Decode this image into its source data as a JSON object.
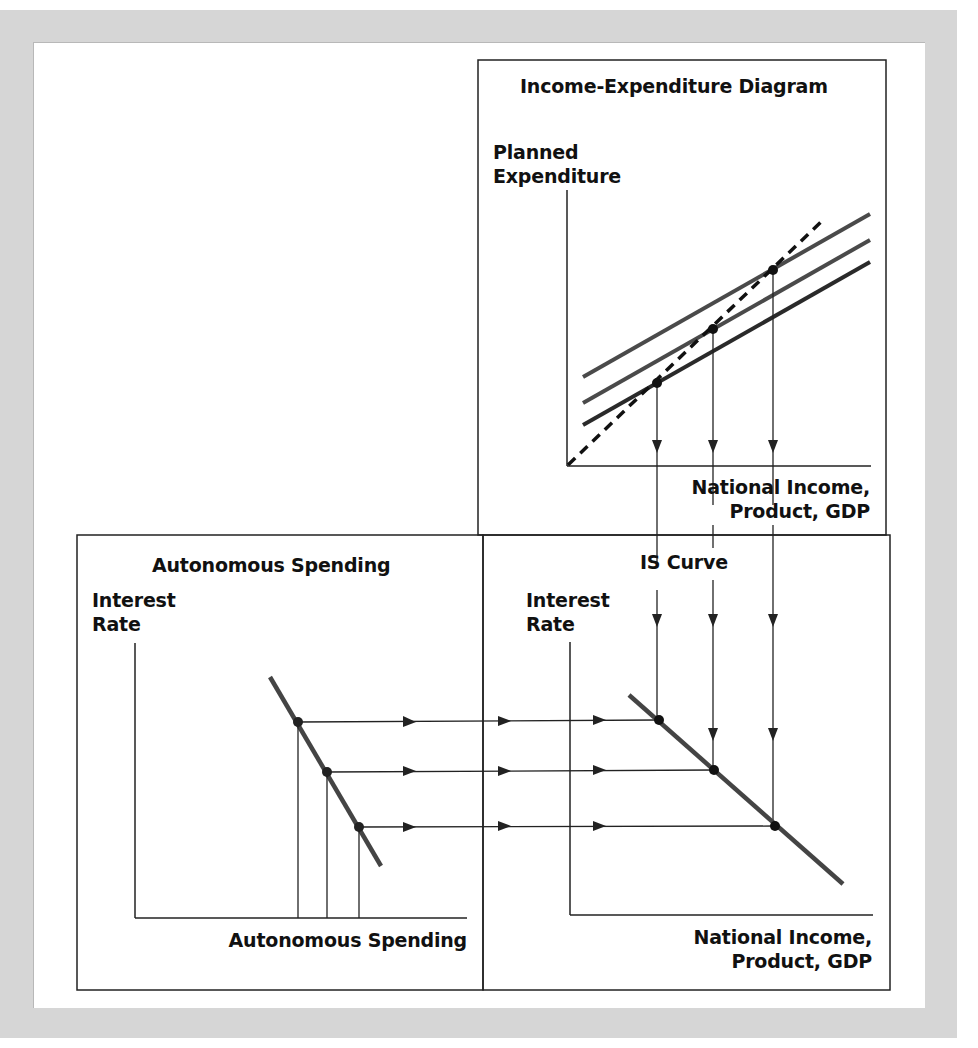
{
  "panels": {
    "income_expenditure": {
      "title": "Income-Expenditure Diagram",
      "y_axis_label_line1": "Planned",
      "y_axis_label_line2": "Expenditure",
      "x_axis_label_line1": "National Income,",
      "x_axis_label_line2": "Product, GDP",
      "curves": [
        "Planned expenditure (high)",
        "Planned expenditure (medium)",
        "Planned expenditure (low)",
        "45-degree line (dashed)"
      ]
    },
    "autonomous_spending": {
      "title": "Autonomous Spending",
      "y_axis_label_line1": "Interest",
      "y_axis_label_line2": "Rate",
      "x_axis_label": "Autonomous Spending"
    },
    "is_curve": {
      "title": "IS Curve",
      "y_axis_label_line1": "Interest",
      "y_axis_label_line2": "Rate",
      "x_axis_label_line1": "National Income,",
      "x_axis_label_line2": "Product, GDP"
    }
  },
  "colors": {
    "background_frame": "#d6d6d6",
    "curve": "#3a3a3a",
    "axis": "#222222",
    "dot": "#111111"
  }
}
